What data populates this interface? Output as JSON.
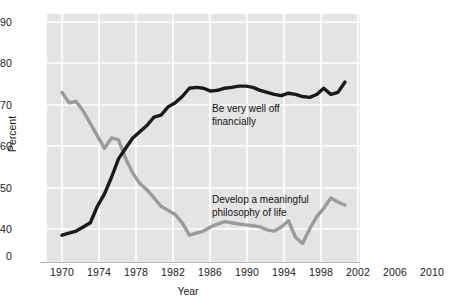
{
  "chart_data": {
    "type": "line",
    "title": "",
    "xlabel": "Year",
    "ylabel": "Percent",
    "xlim": [
      1970,
      2010
    ],
    "ylim": [
      36,
      92
    ],
    "grid": true,
    "grid_color": "#ffffff",
    "plot_background": "#e4e4e4",
    "y_axis_break": true,
    "y_axis_break_between": [
      0,
      40
    ],
    "legend": "inline-annotations",
    "x_ticks": [
      1970,
      1974,
      1978,
      1982,
      1986,
      1990,
      1994,
      1998,
      2002,
      2006,
      2010
    ],
    "x_tick_labels": [
      "1970",
      "1974",
      "1978",
      "1982",
      "1986",
      "1990",
      "1994",
      "1998",
      "2002",
      "2006",
      "2010"
    ],
    "y_ticks": [
      0,
      40,
      50,
      60,
      70,
      80,
      90
    ],
    "y_tick_labels": [
      "0",
      "40",
      "50",
      "60",
      "70",
      "80",
      "90"
    ],
    "x": [
      1970,
      1971,
      1972,
      1973,
      1974,
      1975,
      1976,
      1977,
      1978,
      1979,
      1980,
      1981,
      1982,
      1983,
      1984,
      1985,
      1986,
      1987,
      1988,
      1989,
      1990,
      1991,
      1992,
      1993,
      1994,
      1995,
      1996,
      1997,
      1998,
      1999,
      2000,
      2001,
      2002,
      2003,
      2004,
      2005,
      2006,
      2007,
      2008,
      2009,
      2010
    ],
    "series": [
      {
        "name": "Be very well off financially",
        "color": "#1a1a1a",
        "annotation": "Be very well off\nfinancially",
        "values": [
          38.5,
          39.0,
          39.5,
          40.5,
          41.5,
          45.5,
          48.5,
          52.5,
          57.0,
          59.5,
          62.0,
          63.5,
          65.0,
          67.0,
          67.5,
          69.5,
          70.5,
          72.0,
          74.0,
          74.2,
          74.0,
          73.3,
          73.5,
          74.0,
          74.2,
          74.5,
          74.5,
          74.2,
          73.5,
          73.0,
          72.5,
          72.2,
          72.8,
          72.5,
          72.0,
          71.8,
          72.5,
          74.0,
          72.5,
          73.0,
          75.5
        ]
      },
      {
        "name": "Develop a meaningful philosophy of life",
        "color": "#9b9b9b",
        "annotation": "Develop a meaningful\nphilosophy of life",
        "values": [
          73.0,
          70.5,
          70.8,
          68.5,
          65.5,
          62.5,
          59.5,
          62.0,
          61.5,
          57.0,
          53.5,
          51.0,
          49.5,
          47.5,
          45.5,
          44.5,
          43.5,
          41.5,
          38.5,
          39.0,
          39.5,
          40.5,
          41.2,
          41.8,
          41.5,
          41.2,
          41.0,
          40.8,
          40.5,
          39.8,
          39.5,
          40.5,
          42.0,
          38.0,
          36.5,
          40.0,
          43.0,
          45.0,
          47.5,
          46.5,
          45.8
        ]
      }
    ]
  },
  "axes": {
    "ylabel": "Percent",
    "xlabel": "Year"
  }
}
